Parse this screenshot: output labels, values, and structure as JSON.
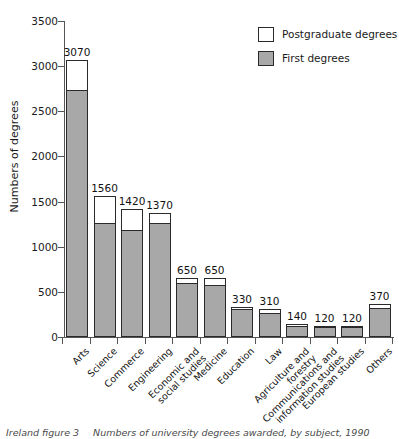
{
  "chart_data": {
    "type": "bar",
    "title": "",
    "xlabel": "",
    "ylabel": "Numbers of degrees",
    "ylim": [
      0,
      3500
    ],
    "yticks": [
      0,
      500,
      1000,
      1500,
      2000,
      2500,
      3000,
      3500
    ],
    "grid": false,
    "stacked": true,
    "legend_position": "top-right",
    "categories": [
      "Arts",
      "Science",
      "Commerce",
      "Engineering",
      "Economic and social studies",
      "Medicine",
      "Education",
      "Law",
      "Agriculture and forestry",
      "Communications and information studies",
      "European studies",
      "Others"
    ],
    "totals": [
      3070,
      1560,
      1420,
      1370,
      650,
      650,
      330,
      310,
      140,
      120,
      120,
      370
    ],
    "series": [
      {
        "name": "First degrees",
        "color": "#a8a8a8",
        "values": [
          2730,
          1250,
          1175,
          1250,
          590,
          570,
          300,
          255,
          110,
          95,
          100,
          310
        ]
      },
      {
        "name": "Postgraduate degrees",
        "color": "#ffffff",
        "values": [
          340,
          310,
          245,
          120,
          60,
          80,
          30,
          55,
          30,
          25,
          20,
          60
        ]
      }
    ],
    "data_labels": [
      "3070",
      "1560",
      "1420",
      "1370",
      "650",
      "650",
      "330",
      "310",
      "140",
      "120",
      "120",
      "370"
    ]
  },
  "legend": {
    "items": [
      {
        "label": "Postgraduate degrees",
        "swatch": "post"
      },
      {
        "label": "First degrees",
        "swatch": "first"
      }
    ]
  },
  "caption": {
    "label": "Ireland figure 3",
    "text": "Numbers of university degrees awarded, by subject, 1990"
  }
}
